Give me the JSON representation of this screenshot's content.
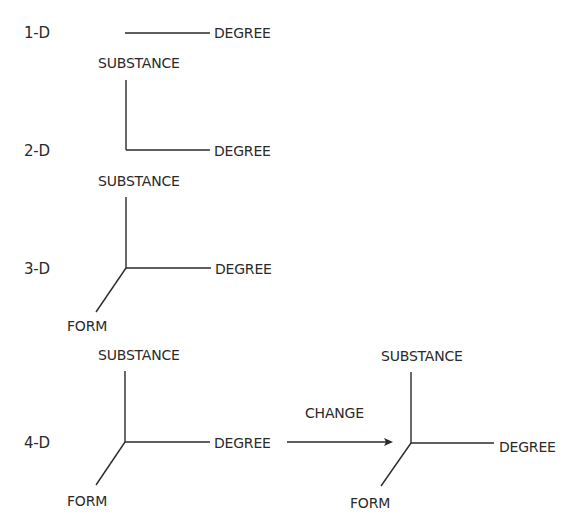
{
  "diagram": {
    "rows": [
      {
        "dimension": "1-D",
        "axes": {
          "degree": "DEGREE",
          "substance": "SUBSTANCE"
        }
      },
      {
        "dimension": "2-D",
        "axes": {
          "degree": "DEGREE",
          "substance": "SUBSTANCE"
        }
      },
      {
        "dimension": "3-D",
        "axes": {
          "degree": "DEGREE",
          "form": "FORM",
          "substance": "SUBSTANCE"
        }
      },
      {
        "dimension": "4-D",
        "axes": {
          "degree": "DEGREE",
          "form": "FORM"
        },
        "transition": {
          "label": "CHANGE"
        },
        "changed_axes": {
          "substance": "SUBSTANCE",
          "degree": "DEGREE",
          "form": "FORM"
        }
      }
    ],
    "colors": {
      "line": "#2a2a2a",
      "background": "#ffffff"
    }
  }
}
